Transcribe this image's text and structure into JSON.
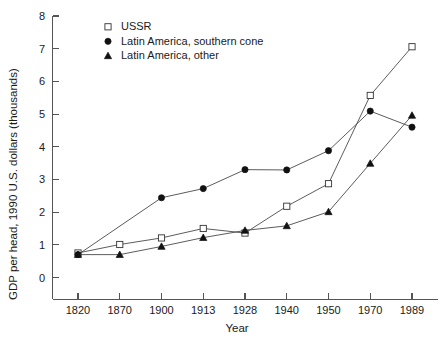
{
  "chart_data": {
    "type": "line",
    "title": "",
    "xlabel": "Year",
    "ylabel": "GDP per head, 1990 U.S. dollars (thousands)",
    "categories": [
      "1820",
      "1870",
      "1900",
      "1913",
      "1928",
      "1940",
      "1950",
      "1970",
      "1989"
    ],
    "xticklabels": [
      "1820",
      "1870",
      "1900",
      "1913",
      "1928",
      "1940",
      "1950",
      "1970",
      "1989"
    ],
    "yticklabels": [
      "0",
      "1",
      "2",
      "3",
      "4",
      "5",
      "6",
      "7",
      "8"
    ],
    "yticks": [
      0,
      1,
      2,
      3,
      4,
      5,
      6,
      7,
      8
    ],
    "ylim": [
      0,
      8
    ],
    "grid": false,
    "legend_position": "upper left",
    "series": [
      {
        "name": "USSR",
        "marker": "open-square",
        "color": "#333333",
        "values": [
          0.75,
          1.01,
          1.21,
          1.5,
          1.36,
          2.18,
          2.87,
          5.57,
          7.06
        ]
      },
      {
        "name": "Latin America, southern cone",
        "marker": "filled-circle",
        "color": "#111111",
        "values": [
          0.7,
          null,
          2.44,
          2.72,
          3.3,
          3.29,
          3.88,
          5.09,
          4.6
        ]
      },
      {
        "name": "Latin America, other",
        "marker": "filled-triangle",
        "color": "#111111",
        "values": [
          0.7,
          0.7,
          0.95,
          1.22,
          1.44,
          1.58,
          2.01,
          3.49,
          4.96
        ]
      }
    ]
  },
  "legend": {
    "items": [
      {
        "label": "USSR",
        "marker": "open-square"
      },
      {
        "label": "Latin America, southern cone",
        "marker": "filled-circle"
      },
      {
        "label": "Latin America, other",
        "marker": "filled-triangle"
      }
    ]
  },
  "axes": {
    "x_title": "Year",
    "y_title": "GDP per head, 1990 U.S. dollars (thousands)"
  },
  "caption": {
    "text": ""
  }
}
